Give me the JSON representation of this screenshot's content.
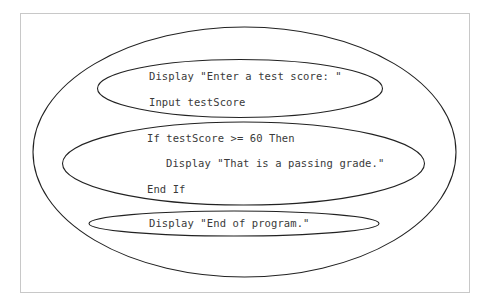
{
  "diagram": {
    "type": "nested-ellipses",
    "colors": {
      "stroke": "#222222",
      "frame": "#c8c8c8",
      "text": "#3a3a3a"
    },
    "blocks": [
      {
        "lines": [
          "Display \"Enter a test score: \"",
          "Input testScore"
        ]
      },
      {
        "lines": [
          "If testScore >= 60 Then",
          "Display \"That is a passing grade.\"",
          "End If"
        ]
      },
      {
        "lines": [
          "Display \"End of program.\""
        ]
      }
    ]
  }
}
